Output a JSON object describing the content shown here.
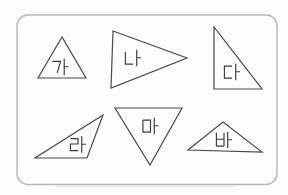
{
  "figure": {
    "type": "triangle-classification-diagram",
    "background": "#fdfdfd",
    "frame": {
      "x": 17,
      "y": 15,
      "width": 260,
      "height": 169.5,
      "radius": 11,
      "stroke": "#b6b6b6"
    },
    "shape_stroke": "#4a4a4a",
    "label_color": "#3a3a3a",
    "label_height": 16,
    "shapes": [
      {
        "id": "ga",
        "label": "가",
        "points": [
          [
            62,
            37
          ],
          [
            38,
            78
          ],
          [
            86,
            78
          ]
        ],
        "label_pos": [
          60.5,
          67
        ]
      },
      {
        "id": "na",
        "label": "나",
        "points": [
          [
            113,
            31
          ],
          [
            187,
            58
          ],
          [
            111,
            88
          ]
        ],
        "label_pos": [
          133,
          58
        ]
      },
      {
        "id": "da",
        "label": "다",
        "points": [
          [
            214,
            27
          ],
          [
            214,
            89
          ],
          [
            262,
            89
          ]
        ],
        "label_pos": [
          232,
          72
        ]
      },
      {
        "id": "ra",
        "label": "라",
        "points": [
          [
            103,
            115
          ],
          [
            35,
            158
          ],
          [
            87,
            158
          ]
        ],
        "label_pos": [
          78,
          144.5
        ]
      },
      {
        "id": "ma",
        "label": "마",
        "points": [
          [
            115,
            108
          ],
          [
            182,
            108
          ],
          [
            150,
            165
          ]
        ],
        "label_pos": [
          150.5,
          126
        ]
      },
      {
        "id": "ba",
        "label": "바",
        "points": [
          [
            223,
            122
          ],
          [
            188,
            150
          ],
          [
            262,
            152
          ]
        ],
        "label_pos": [
          224,
          140
        ]
      }
    ]
  }
}
